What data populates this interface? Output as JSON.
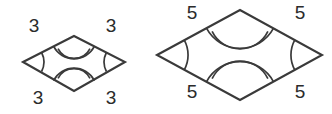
{
  "figure": {
    "stroke_color": "#3a3a3a",
    "text_color": "#2b2b2b",
    "background_color": "#ffffff",
    "shapes": [
      {
        "id": "small-rhombus",
        "name": "Small rhombus",
        "side_length_label": "3",
        "labels": {
          "top_left": "3",
          "top_right": "3",
          "bottom_left": "3",
          "bottom_right": "3"
        },
        "label_positions": {
          "top_left": {
            "x": 34,
            "y": 27
          },
          "top_right": {
            "x": 111,
            "y": 27
          },
          "bottom_left": {
            "x": 38,
            "y": 99
          },
          "bottom_right": {
            "x": 111,
            "y": 99
          }
        },
        "vertices": {
          "left": {
            "x": 23,
            "y": 62
          },
          "top": {
            "x": 74,
            "y": 36
          },
          "right": {
            "x": 125,
            "y": 62
          },
          "bottom": {
            "x": 74,
            "y": 91
          }
        },
        "angle_marks": {
          "left": "single-arc",
          "right": "single-arc",
          "top": "double-arc",
          "bottom": "double-arc"
        }
      },
      {
        "id": "large-rhombus",
        "name": "Large rhombus",
        "side_length_label": "5",
        "labels": {
          "top_left": "5",
          "top_right": "5",
          "bottom_left": "5",
          "bottom_right": "5"
        },
        "label_positions": {
          "top_left": {
            "x": 192,
            "y": 14
          },
          "top_right": {
            "x": 300,
            "y": 14
          },
          "bottom_left": {
            "x": 192,
            "y": 93
          },
          "bottom_right": {
            "x": 300,
            "y": 93
          }
        },
        "vertices": {
          "left": {
            "x": 157,
            "y": 55
          },
          "top": {
            "x": 240,
            "y": 10
          },
          "right": {
            "x": 322,
            "y": 55
          },
          "bottom": {
            "x": 240,
            "y": 100
          }
        },
        "angle_marks": {
          "left": "single-arc",
          "right": "single-arc",
          "top": "double-arc",
          "bottom": "double-arc"
        }
      }
    ]
  }
}
